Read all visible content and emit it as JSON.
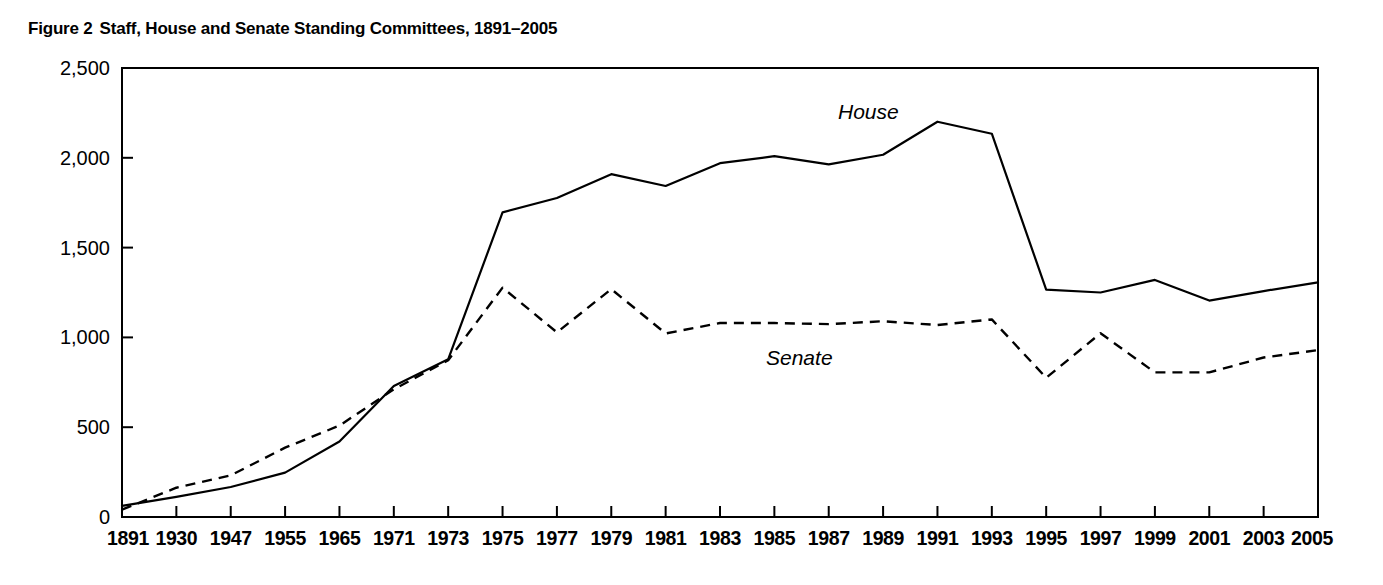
{
  "figure": {
    "number_label": "Figure 2",
    "title": "Staff, House and Senate Standing Committees, 1891–2005",
    "full_caption": "Figure 2  Staff, House and Senate Standing Committees, 1891–2005"
  },
  "chart_data": {
    "type": "line",
    "title": "Staff, House and Senate Standing Committees, 1891–2005",
    "xlabel": "",
    "ylabel": "",
    "xlim": [
      0,
      22
    ],
    "ylim": [
      0,
      2500
    ],
    "ytick_labels": [
      "0",
      "500",
      "1,000",
      "1,500",
      "2,000",
      "2,500"
    ],
    "ytick_values": [
      0,
      500,
      1000,
      1500,
      2000,
      2500
    ],
    "grid": false,
    "legend_position": "inline-annotation",
    "categories": [
      "1891",
      "1930",
      "1947",
      "1955",
      "1965",
      "1971",
      "1973",
      "1975",
      "1977",
      "1979",
      "1981",
      "1983",
      "1985",
      "1987",
      "1989",
      "1991",
      "1993",
      "1995",
      "1997",
      "1999",
      "2001",
      "2003",
      "2005"
    ],
    "series": [
      {
        "name": "House",
        "style": "solid",
        "color": "#000000",
        "label_text": "House",
        "values": [
          62,
          112,
          167,
          247,
          420,
          729,
          878,
          1696,
          1776,
          1909,
          1843,
          1970,
          2009,
          1963,
          2017,
          2201,
          2134,
          1266,
          1250,
          1320,
          1205,
          1258,
          1306
        ]
      },
      {
        "name": "Senate",
        "style": "dashed",
        "color": "#000000",
        "label_text": "Senate",
        "values": [
          41,
          163,
          232,
          386,
          509,
          711,
          873,
          1277,
          1028,
          1269,
          1022,
          1080,
          1080,
          1074,
          1090,
          1069,
          1100,
          775,
          1023,
          805,
          805,
          888,
          929
        ]
      }
    ],
    "annotations": [
      {
        "text": "House",
        "series": "House",
        "x_category": "1991"
      },
      {
        "text": "Senate",
        "series": "Senate",
        "x_category": "1985"
      }
    ]
  }
}
